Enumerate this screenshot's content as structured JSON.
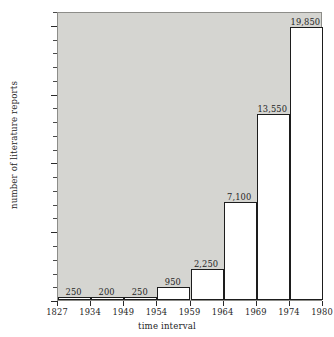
{
  "chart_data": {
    "type": "bar",
    "title": "",
    "subtitle": "",
    "xlabel": "time interval",
    "ylabel": "number of literature reports",
    "grid": false,
    "legend": "none",
    "ylim": [
      0,
      21000
    ],
    "y_ticks_major": [
      0,
      5000,
      10000,
      15000,
      20000
    ],
    "y_tick_labels": [
      "",
      "5,000",
      "10,000",
      "15,000",
      "20,000"
    ],
    "y_minor_step": 1000,
    "x_boundaries": [
      "1827",
      "1934",
      "1949",
      "1954",
      "1959",
      "1964",
      "1969",
      "1974",
      "1980"
    ],
    "categories": [
      "1827-1934",
      "1934-1949",
      "1949-1954",
      "1954-1959",
      "1959-1964",
      "1964-1969",
      "1969-1974",
      "1974-1980"
    ],
    "values": [
      250,
      200,
      250,
      950,
      2250,
      7100,
      13550,
      19850
    ],
    "data_labels": [
      "250",
      "200",
      "250",
      "950",
      "2,250",
      "7,100",
      "13,550",
      "19,850"
    ],
    "colors": {
      "plot_background": "#d5d5d1",
      "bar_fill": "#ffffff",
      "bar_stroke": "#1d1d1d",
      "text": "#262626",
      "page_background": "#ffffff"
    }
  }
}
